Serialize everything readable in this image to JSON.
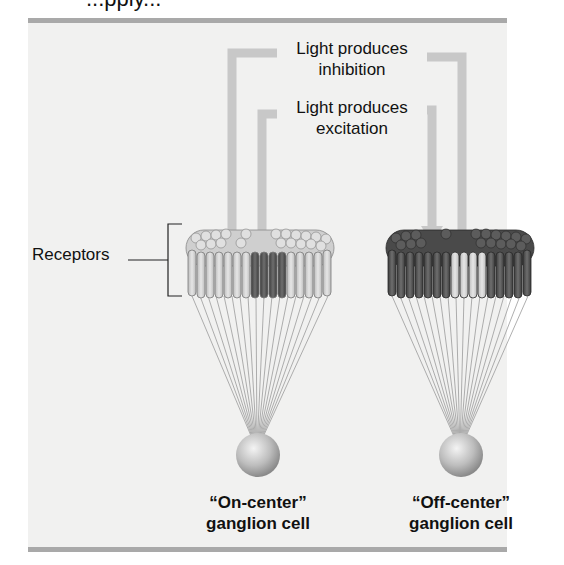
{
  "header_fragment": "...pply...",
  "labels": {
    "inhibition_line1": "Light produces",
    "inhibition_line2": "inhibition",
    "excitation_line1": "Light produces",
    "excitation_line2": "excitation",
    "receptors": "Receptors"
  },
  "cells": [
    {
      "id": "on-center",
      "title": "“On-center”",
      "subtitle": "ganglion cell",
      "surround": "light",
      "center": "dark"
    },
    {
      "id": "off-center",
      "title": "“Off-center”",
      "subtitle": "ganglion cell",
      "surround": "dark",
      "center": "light"
    }
  ],
  "colors": {
    "panel": "#f1f1f0",
    "rule": "#a9a9a9",
    "arrow": "#c8c8c8",
    "light_receptor": "#d9d9d9",
    "dark_receptor": "#5a5a5a",
    "ganglion": "#c4c4c4"
  }
}
